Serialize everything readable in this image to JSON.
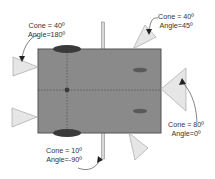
{
  "diagram": {
    "title": "",
    "colors": {
      "body": "#8a8a8a",
      "body_border": "#555555",
      "wheel": "#3a3a3a",
      "small_ellipse": "#5a5a5a",
      "cone_fill": "#e6e6e6",
      "cone_stroke": "#9a9a9a",
      "text": "#333333"
    },
    "sensors": [
      {
        "id": "left-top",
        "cone": "Cone = 40º",
        "angle": "Angle=180º"
      },
      {
        "id": "top-right",
        "cone": "Cone = 40º",
        "angle": "Angle=45º"
      },
      {
        "id": "right",
        "cone": "Cone = 80º",
        "angle": "Angle=0º"
      },
      {
        "id": "bottom-bar",
        "cone": "Cone = 10º",
        "angle": "Angle=-90º"
      }
    ]
  }
}
